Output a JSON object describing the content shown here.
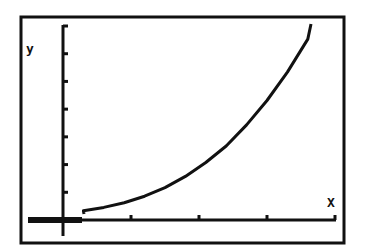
{
  "screen": {
    "background": "#ffffff",
    "ink": "#111111"
  },
  "chart_data": {
    "type": "line",
    "title": "",
    "xlabel": "X",
    "ylabel": "y",
    "grid": false,
    "legend": null,
    "x_ticks_count": 4,
    "y_ticks_count": 7,
    "xlim": [
      -0.6,
      4.0
    ],
    "ylim": [
      -0.3,
      3.0
    ],
    "x": [
      0.3,
      0.6,
      0.9,
      1.2,
      1.5,
      1.8,
      2.1,
      2.4,
      2.7,
      3.0,
      3.3,
      3.6
    ],
    "y": [
      0.05,
      0.1,
      0.17,
      0.27,
      0.4,
      0.57,
      0.78,
      1.03,
      1.35,
      1.72,
      2.15,
      2.65
    ]
  }
}
